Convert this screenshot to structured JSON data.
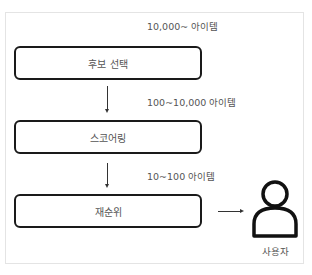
{
  "diagram": {
    "stages": [
      {
        "label": "후보 선택",
        "count_label": "10,000~ 아이템"
      },
      {
        "label": "스코어링",
        "count_label": "100~10,000 아이템"
      },
      {
        "label": "재순위",
        "count_label": "10~100 아이템"
      }
    ],
    "user": {
      "label": "사용자",
      "icon": "user-icon"
    },
    "colors": {
      "stroke": "#1a1a1a",
      "text": "#555555",
      "frame": "#e4e4e4"
    }
  }
}
